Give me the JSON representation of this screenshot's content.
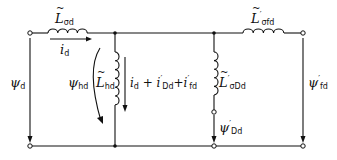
{
  "diagram": {
    "type": "equivalent-circuit",
    "colors": {
      "line": "#111111",
      "background": "#ffffff"
    },
    "components": {
      "L_sigma_d": {
        "symbol": "L",
        "sub": "σd",
        "kind": "series-inductor"
      },
      "L_hd": {
        "symbol": "L",
        "sub": "hd",
        "kind": "shunt-inductor"
      },
      "L_sigma_Dd": {
        "symbol": "L",
        "sub": "σDd",
        "prime": "′",
        "kind": "shunt-inductor"
      },
      "L_sigma_fd": {
        "symbol": "L",
        "sub": "σfd",
        "prime": "′",
        "kind": "series-inductor"
      }
    },
    "labels": {
      "i_d": {
        "symbol": "i",
        "sub": "d"
      },
      "current_sum": {
        "text1": "i",
        "sub1": "d",
        "plus1": " + ",
        "text2": "i",
        "prime2": "′",
        "sub2": "Dd",
        "plus2": "+",
        "text3": "i",
        "prime3": "′",
        "sub3": "fd"
      },
      "psi_d": {
        "symbol": "ψ",
        "sub": "d"
      },
      "psi_hd": {
        "symbol": "ψ",
        "sub": "hd"
      },
      "psi_Dd": {
        "symbol": "ψ",
        "prime": "′",
        "sub": "Dd"
      },
      "psi_fd": {
        "symbol": "ψ",
        "prime": "′",
        "sub": "fd"
      }
    }
  }
}
